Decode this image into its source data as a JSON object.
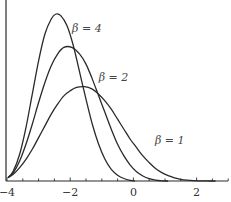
{
  "chart_data": {
    "type": "line",
    "title": "",
    "xlabel": "",
    "ylabel": "",
    "xlim": [
      -4,
      3
    ],
    "ylim": [
      0,
      1.08
    ],
    "grid": false,
    "legend_position": "inline labels",
    "x_ticks": [
      -4,
      -2,
      0,
      2
    ],
    "x_tick_labels": [
      "−4",
      "−2",
      "0",
      "2"
    ],
    "minor_tick_step": 0.5,
    "series": [
      {
        "name": "β = 4",
        "label": "β = 4",
        "label_pos": [
          -1.94,
          0.89
        ],
        "points": [
          [
            -3.97,
            0.02
          ],
          [
            -3.8,
            0.06
          ],
          [
            -3.6,
            0.16
          ],
          [
            -3.4,
            0.32
          ],
          [
            -3.2,
            0.52
          ],
          [
            -3.0,
            0.72
          ],
          [
            -2.8,
            0.88
          ],
          [
            -2.6,
            0.97
          ],
          [
            -2.45,
            1.0
          ],
          [
            -2.3,
            0.99
          ],
          [
            -2.1,
            0.93
          ],
          [
            -1.9,
            0.81
          ],
          [
            -1.7,
            0.65
          ],
          [
            -1.5,
            0.49
          ],
          [
            -1.3,
            0.34
          ],
          [
            -1.1,
            0.22
          ],
          [
            -0.9,
            0.13
          ],
          [
            -0.7,
            0.07
          ],
          [
            -0.5,
            0.035
          ],
          [
            -0.3,
            0.015
          ],
          [
            -0.1,
            0.004
          ],
          [
            0.05,
            0.0
          ]
        ]
      },
      {
        "name": "β = 2",
        "label": "β = 2",
        "label_pos": [
          -1.1,
          0.6
        ],
        "points": [
          [
            -3.97,
            0.02
          ],
          [
            -3.8,
            0.05
          ],
          [
            -3.6,
            0.12
          ],
          [
            -3.4,
            0.22
          ],
          [
            -3.2,
            0.34
          ],
          [
            -3.0,
            0.47
          ],
          [
            -2.8,
            0.59
          ],
          [
            -2.6,
            0.69
          ],
          [
            -2.4,
            0.76
          ],
          [
            -2.2,
            0.8
          ],
          [
            -1.95,
            0.8
          ],
          [
            -1.7,
            0.76
          ],
          [
            -1.5,
            0.7
          ],
          [
            -1.3,
            0.61
          ],
          [
            -1.1,
            0.51
          ],
          [
            -0.9,
            0.41
          ],
          [
            -0.7,
            0.31
          ],
          [
            -0.5,
            0.22
          ],
          [
            -0.3,
            0.15
          ],
          [
            -0.1,
            0.095
          ],
          [
            0.1,
            0.055
          ],
          [
            0.3,
            0.03
          ],
          [
            0.5,
            0.014
          ],
          [
            0.7,
            0.005
          ],
          [
            0.9,
            0.001
          ],
          [
            1.1,
            0.0
          ]
        ]
      },
      {
        "name": "β = 1",
        "label": "β = 1",
        "label_pos": [
          0.68,
          0.22
        ],
        "points": [
          [
            -3.97,
            0.02
          ],
          [
            -3.8,
            0.04
          ],
          [
            -3.6,
            0.08
          ],
          [
            -3.4,
            0.13
          ],
          [
            -3.2,
            0.19
          ],
          [
            -3.0,
            0.26
          ],
          [
            -2.8,
            0.33
          ],
          [
            -2.6,
            0.4
          ],
          [
            -2.4,
            0.46
          ],
          [
            -2.2,
            0.51
          ],
          [
            -2.0,
            0.54
          ],
          [
            -1.8,
            0.56
          ],
          [
            -1.55,
            0.565
          ],
          [
            -1.3,
            0.55
          ],
          [
            -1.1,
            0.52
          ],
          [
            -0.9,
            0.48
          ],
          [
            -0.7,
            0.43
          ],
          [
            -0.5,
            0.37
          ],
          [
            -0.3,
            0.31
          ],
          [
            -0.1,
            0.25
          ],
          [
            0.1,
            0.2
          ],
          [
            0.3,
            0.15
          ],
          [
            0.5,
            0.11
          ],
          [
            0.7,
            0.075
          ],
          [
            0.9,
            0.05
          ],
          [
            1.1,
            0.032
          ],
          [
            1.3,
            0.019
          ],
          [
            1.5,
            0.01
          ],
          [
            1.7,
            0.005
          ],
          [
            1.9,
            0.002
          ],
          [
            2.1,
            0.0008
          ],
          [
            2.3,
            0.0002
          ],
          [
            2.6,
            0.0
          ]
        ]
      }
    ]
  },
  "layout": {
    "x0_px": 7,
    "px_per_x": 31.6,
    "baseline_px": 181,
    "px_per_y": 167,
    "x_axis_end_px": 228,
    "y_axis_top_px": 0
  }
}
